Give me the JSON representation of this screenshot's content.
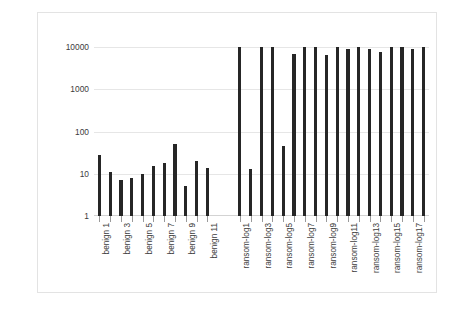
{
  "chart_data": {
    "type": "bar",
    "title": "",
    "subtitle": "",
    "xlabel": "",
    "ylabel": "Number of Different File Types",
    "yscale": "log",
    "ylim": [
      1,
      10000
    ],
    "ytick_labels": [
      "1",
      "10",
      "100",
      "1000",
      "10000"
    ],
    "ytick_values": [
      1,
      10,
      100,
      1000,
      10000
    ],
    "grid": true,
    "legend": false,
    "bar_color": "#262626",
    "gridline_color": "#e6e6e6",
    "frame_color": "#e3e3e3",
    "categories": [
      "benign 1",
      "benign 2",
      "benign 3",
      "benign 4",
      "benign 5",
      "benign 6",
      "benign 7",
      "benign 8",
      "benign 9",
      "benign 10",
      "benign 11",
      "",
      "",
      "ransom-log1",
      "ransom-log2",
      "ransom-log3",
      "ransom-log4",
      "ransom-log5",
      "ransom-log6",
      "ransom-log7",
      "ransom-log8",
      "ransom-log9",
      "ransom-log10",
      "ransom-log11",
      "ransom-log12",
      "ransom-log13",
      "ransom-log14",
      "ransom-log15",
      "ransom-log16",
      "ransom-log17",
      "ransom-log18"
    ],
    "visible_tick_labels": [
      "benign 1",
      "",
      "benign 3",
      "",
      "benign 5",
      "",
      "benign 7",
      "",
      "benign 9",
      "",
      "benign 11",
      "",
      "",
      "ransom-log1",
      "",
      "ransom-log3",
      "",
      "ransom-log5",
      "",
      "ransom-log7",
      "",
      "ransom-log9",
      "",
      "ransom-log11",
      "",
      "ransom-log13",
      "",
      "ransom-log15",
      "",
      "ransom-log17",
      ""
    ],
    "values": [
      28,
      11,
      7,
      8,
      10,
      15,
      18,
      52,
      5,
      20,
      14,
      null,
      null,
      10000,
      13,
      10000,
      10000,
      45,
      7000,
      10000,
      10000,
      6500,
      10000,
      9000,
      10000,
      9000,
      7500,
      10000,
      10000,
      9000,
      10000
    ],
    "groups": [
      {
        "name": "benign",
        "count": 11
      },
      {
        "name": "ransomware",
        "count": 18
      }
    ],
    "gap_after_index": 10
  }
}
